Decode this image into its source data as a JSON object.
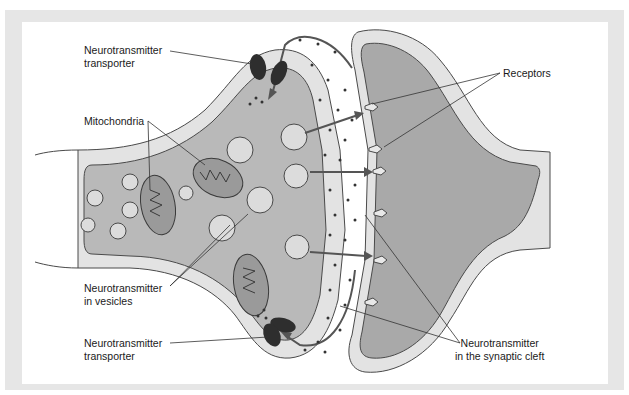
{
  "figure": {
    "colors": {
      "frame": "#e6e6e6",
      "panel": "#ffffff",
      "axon_cytoplasm": "#b9b9b9",
      "dendrite_cytoplasm": "#a9a9a9",
      "membrane_band": "#e3e3e3",
      "membrane_line": "#4a4a4a",
      "transporter": "#2e2e2e",
      "neurotransmitter_dot": "#333333",
      "arrow": "#555555"
    },
    "labels": {
      "transporter_top_line1": "Neurotransmitter",
      "transporter_top_line2": "transporter",
      "mitochondria": "Mitochondria",
      "vesicles_line1": "Neurotransmitter",
      "vesicles_line2": "in vesicles",
      "transporter_bottom_line1": "Neurotransmitter",
      "transporter_bottom_line2": "transporter",
      "receptors": "Receptors",
      "cleft_line1": "Neurotransmitter",
      "cleft_line2": "in the synaptic cleft"
    }
  }
}
